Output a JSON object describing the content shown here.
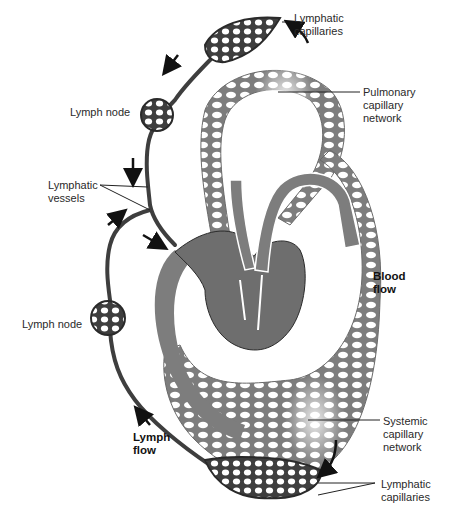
{
  "diagram": {
    "type": "lymphatic and blood circulation",
    "colors": {
      "blood_vessel": "#7d7d7d",
      "lymph_vessel": "#3e3e3e",
      "outline": "#2a2a2a",
      "background": "#ffffff",
      "arrow": "#111111"
    }
  },
  "labels": {
    "lymphatic_capillaries_top": "Lymphatic\ncapillaries",
    "pulmonary_capillary_network": "Pulmonary\ncapillary\nnetwork",
    "lymph_node_upper": "Lymph node",
    "lymphatic_vessels": "Lymphatic\nvessels",
    "blood_flow": "Blood\nflow",
    "lymph_node_lower": "Lymph node",
    "systemic_capillary_network": "Systemic\ncapillary\nnetwork",
    "lymph_flow": "Lymph\nflow",
    "lymphatic_capillaries_bottom": "Lymphatic\ncapillaries"
  }
}
